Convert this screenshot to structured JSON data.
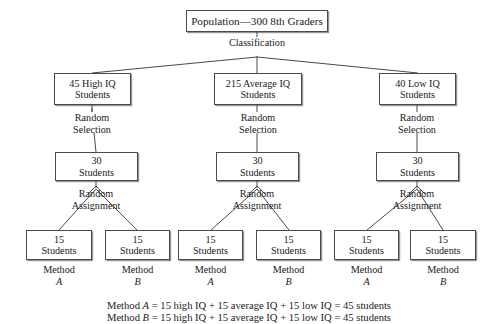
{
  "diagram": {
    "title_box": {
      "text": "Population—300 8th Graders"
    },
    "classification_label": "Classification",
    "groups": [
      {
        "id": "high-iq",
        "level1": {
          "line1": "45 High IQ",
          "line2": "Students"
        },
        "selection_label": {
          "line1": "Random",
          "line2": "Selection"
        },
        "level2": {
          "line1": "30",
          "line2": "Students"
        },
        "assignment_label": {
          "line1": "Random",
          "line2": "Assignment"
        },
        "level3": [
          {
            "line1": "15",
            "line2": "Students",
            "method_name": "Method",
            "method_letter": "A"
          },
          {
            "line1": "15",
            "line2": "Students",
            "method_name": "Method",
            "method_letter": "B"
          }
        ]
      },
      {
        "id": "average-iq",
        "level1": {
          "line1": "215 Average IQ",
          "line2": "Students"
        },
        "selection_label": {
          "line1": "Random",
          "line2": "Selection"
        },
        "level2": {
          "line1": "30",
          "line2": "Students"
        },
        "assignment_label": {
          "line1": "Random",
          "line2": "Assignment"
        },
        "level3": [
          {
            "line1": "15",
            "line2": "Students",
            "method_name": "Method",
            "method_letter": "A"
          },
          {
            "line1": "15",
            "line2": "Students",
            "method_name": "Method",
            "method_letter": "B"
          }
        ]
      },
      {
        "id": "low-iq",
        "level1": {
          "line1": "40 Low IQ",
          "line2": "Students"
        },
        "selection_label": {
          "line1": "Random",
          "line2": "Selection"
        },
        "level2": {
          "line1": "30",
          "line2": "Students"
        },
        "assignment_label": {
          "line1": "Random",
          "line2": "Assignment"
        },
        "level3": [
          {
            "line1": "15",
            "line2": "Students",
            "method_name": "Method",
            "method_letter": "A"
          },
          {
            "line1": "15",
            "line2": "Students",
            "method_name": "Method",
            "method_letter": "B"
          }
        ]
      }
    ],
    "summary_lines": [
      {
        "prefix": "Method ",
        "letter": "A",
        "rest": " = 15 high IQ + 15 average IQ + 15 low IQ = 45 students"
      },
      {
        "prefix": "Method ",
        "letter": "B",
        "rest": " = 15 high IQ + 15 average IQ + 15 low IQ = 45 students"
      }
    ],
    "colors": {
      "line": "#4a4a4a",
      "text": "#1a1a1a",
      "background": "#ffffff"
    }
  }
}
